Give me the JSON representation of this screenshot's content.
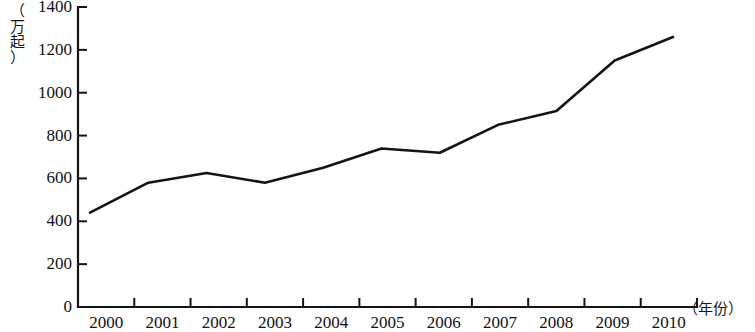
{
  "chart_data": {
    "type": "line",
    "title": "",
    "subtitle": "",
    "xlabel": "（年份）",
    "ylabel": "（万起）",
    "categories": [
      "2000",
      "2001",
      "2002",
      "2003",
      "2004",
      "2005",
      "2006",
      "2007",
      "2008",
      "2009",
      "2010"
    ],
    "x": [
      2000,
      2001,
      2002,
      2003,
      2004,
      2005,
      2006,
      2007,
      2008,
      2009,
      2010
    ],
    "values": [
      440,
      580,
      625,
      580,
      650,
      740,
      720,
      850,
      915,
      1150,
      1260
    ],
    "series": [
      {
        "name": "",
        "values": [
          440,
          580,
          625,
          580,
          650,
          740,
          720,
          850,
          915,
          1150,
          1260
        ]
      }
    ],
    "ylim": [
      0,
      1400
    ],
    "ytick_values": [
      0,
      200,
      400,
      600,
      800,
      1000,
      1200,
      1400
    ],
    "ytick_labels": [
      "0",
      "200",
      "400",
      "600",
      "800",
      "1000",
      "1200",
      "1400"
    ],
    "xtick_labels": [
      "2000",
      "2001",
      "2002",
      "2003",
      "2004",
      "2005",
      "2006",
      "2007",
      "2008",
      "2009",
      "2010"
    ],
    "grid": false,
    "legend": null,
    "legend_position": "none",
    "line_color": "#141414",
    "axis_color": "#141414",
    "background_color": "#ffffff",
    "annotations": []
  },
  "axis": {
    "y_unit_text": "（\n万\n起\n）",
    "x_unit_text": "（年份）"
  }
}
